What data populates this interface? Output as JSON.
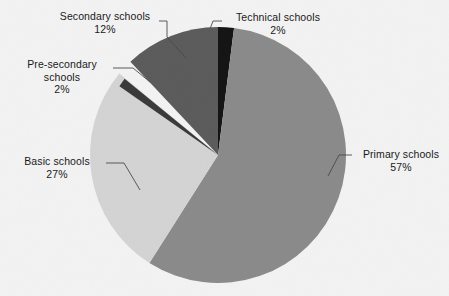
{
  "chart_data": {
    "type": "pie",
    "title": "",
    "subtitle": "",
    "xlabel": "",
    "ylabel": "",
    "legend_position": "none",
    "grid": false,
    "start_angle_deg": 0,
    "direction": "clockwise",
    "center": {
      "x": 218,
      "y": 155
    },
    "radius": 128,
    "categories": [
      "Technical schools",
      "Primary schools",
      "Basic schools",
      "Pre-secondary schools",
      "Secondary schools"
    ],
    "values": [
      2,
      57,
      27,
      2,
      12
    ],
    "unit": "%",
    "slices": [
      {
        "label": "Technical schools",
        "value": 2,
        "value_text": "2%",
        "color": "#141414",
        "label_lines": [
          "Technical schools",
          "2%"
        ]
      },
      {
        "label": "Primary schools",
        "value": 57,
        "value_text": "57%",
        "color": "#8a8a8a",
        "label_lines": [
          "Primary schools",
          "57%"
        ]
      },
      {
        "label": "Basic schools",
        "value": 27,
        "value_text": "27%",
        "color": "#d3d3d3",
        "label_lines": [
          "Basic schools",
          "27%"
        ]
      },
      {
        "label": "Pre-secondary schools",
        "value": 2,
        "value_text": "2%",
        "color": "#3a3a3a",
        "label_lines": [
          "Pre-secondary",
          "schools",
          "2%"
        ]
      },
      {
        "label": "Secondary schools",
        "value": 12,
        "value_text": "12%",
        "color": "#5b5b5b",
        "label_lines": [
          "Secondary schools",
          "12%"
        ]
      }
    ]
  },
  "labels": {
    "technical": {
      "name": "Technical schools",
      "pct": "2%"
    },
    "primary": {
      "name": "Primary schools",
      "pct": "57%"
    },
    "basic": {
      "name": "Basic schools",
      "pct": "27%"
    },
    "presecondary": {
      "name_line1": "Pre-secondary",
      "name_line2": "schools",
      "pct": "2%"
    },
    "secondary": {
      "name": "Secondary schools",
      "pct": "12%"
    }
  },
  "colors": {
    "background": "#f2f2f2",
    "text": "#1a1a1a",
    "leader_line": "#4a4a4a",
    "primary_slice": "#8a8a8a",
    "basic_slice": "#d3d3d3",
    "secondary_slice": "#5b5b5b",
    "presecondary_slice": "#3a3a3a",
    "technical_slice": "#141414"
  }
}
